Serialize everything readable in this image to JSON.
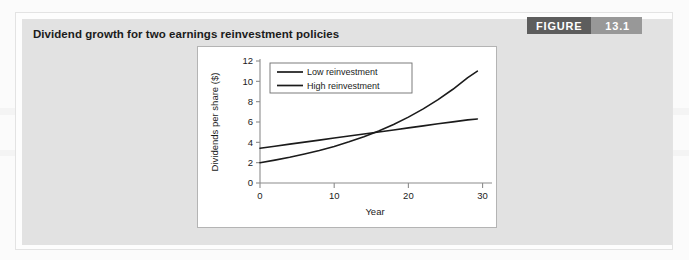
{
  "figure": {
    "caption": "Dividend growth for two earnings reinvestment policies",
    "badge_word": "FIGURE",
    "badge_number": "13.1"
  },
  "colors": {
    "panel_gray": "#e2e2e2",
    "badge_dark": "#5d5d5d",
    "badge_light": "#989898",
    "line": "#1b1b1b",
    "axis": "#8c8c8c",
    "card_border": "#b4b4b4"
  },
  "chart_data": {
    "type": "line",
    "title": "Dividend growth for two earnings reinvestment policies",
    "xlabel": "Year",
    "ylabel": "Dividends per share ($)",
    "xlim": [
      0,
      31
    ],
    "ylim": [
      0,
      12
    ],
    "xticks": [
      0,
      10,
      20,
      30
    ],
    "xtick_labels": [
      "0",
      "10",
      "20",
      "30"
    ],
    "yticks": [
      0,
      2,
      4,
      6,
      8,
      10,
      12
    ],
    "ytick_labels": [
      "0",
      "2",
      "4",
      "6",
      "8",
      "10",
      "12"
    ],
    "grid": false,
    "legend_position": "upper-left-inside",
    "x": [
      0,
      2,
      4,
      6,
      8,
      10,
      12,
      14,
      16,
      18,
      20,
      22,
      24,
      26,
      28,
      29.3
    ],
    "series": [
      {
        "name": "Low reinvestment",
        "shape": "linear",
        "values": [
          3.42,
          3.62,
          3.82,
          4.02,
          4.22,
          4.42,
          4.62,
          4.82,
          5.02,
          5.22,
          5.42,
          5.62,
          5.82,
          6.01,
          6.21,
          6.3
        ]
      },
      {
        "name": "High reinvestment",
        "shape": "exponential",
        "values": [
          2.0,
          2.25,
          2.53,
          2.85,
          3.2,
          3.6,
          4.05,
          4.55,
          5.12,
          5.76,
          6.48,
          7.29,
          8.2,
          9.22,
          10.37,
          11.0
        ]
      }
    ],
    "intersection": {
      "x": 13.5,
      "y": 4.72
    },
    "annotations": []
  },
  "legend": {
    "items": [
      {
        "label": "Low reinvestment",
        "swatch": "line-swatch-low"
      },
      {
        "label": "High reinvestment",
        "swatch": "line-swatch-high"
      }
    ]
  }
}
